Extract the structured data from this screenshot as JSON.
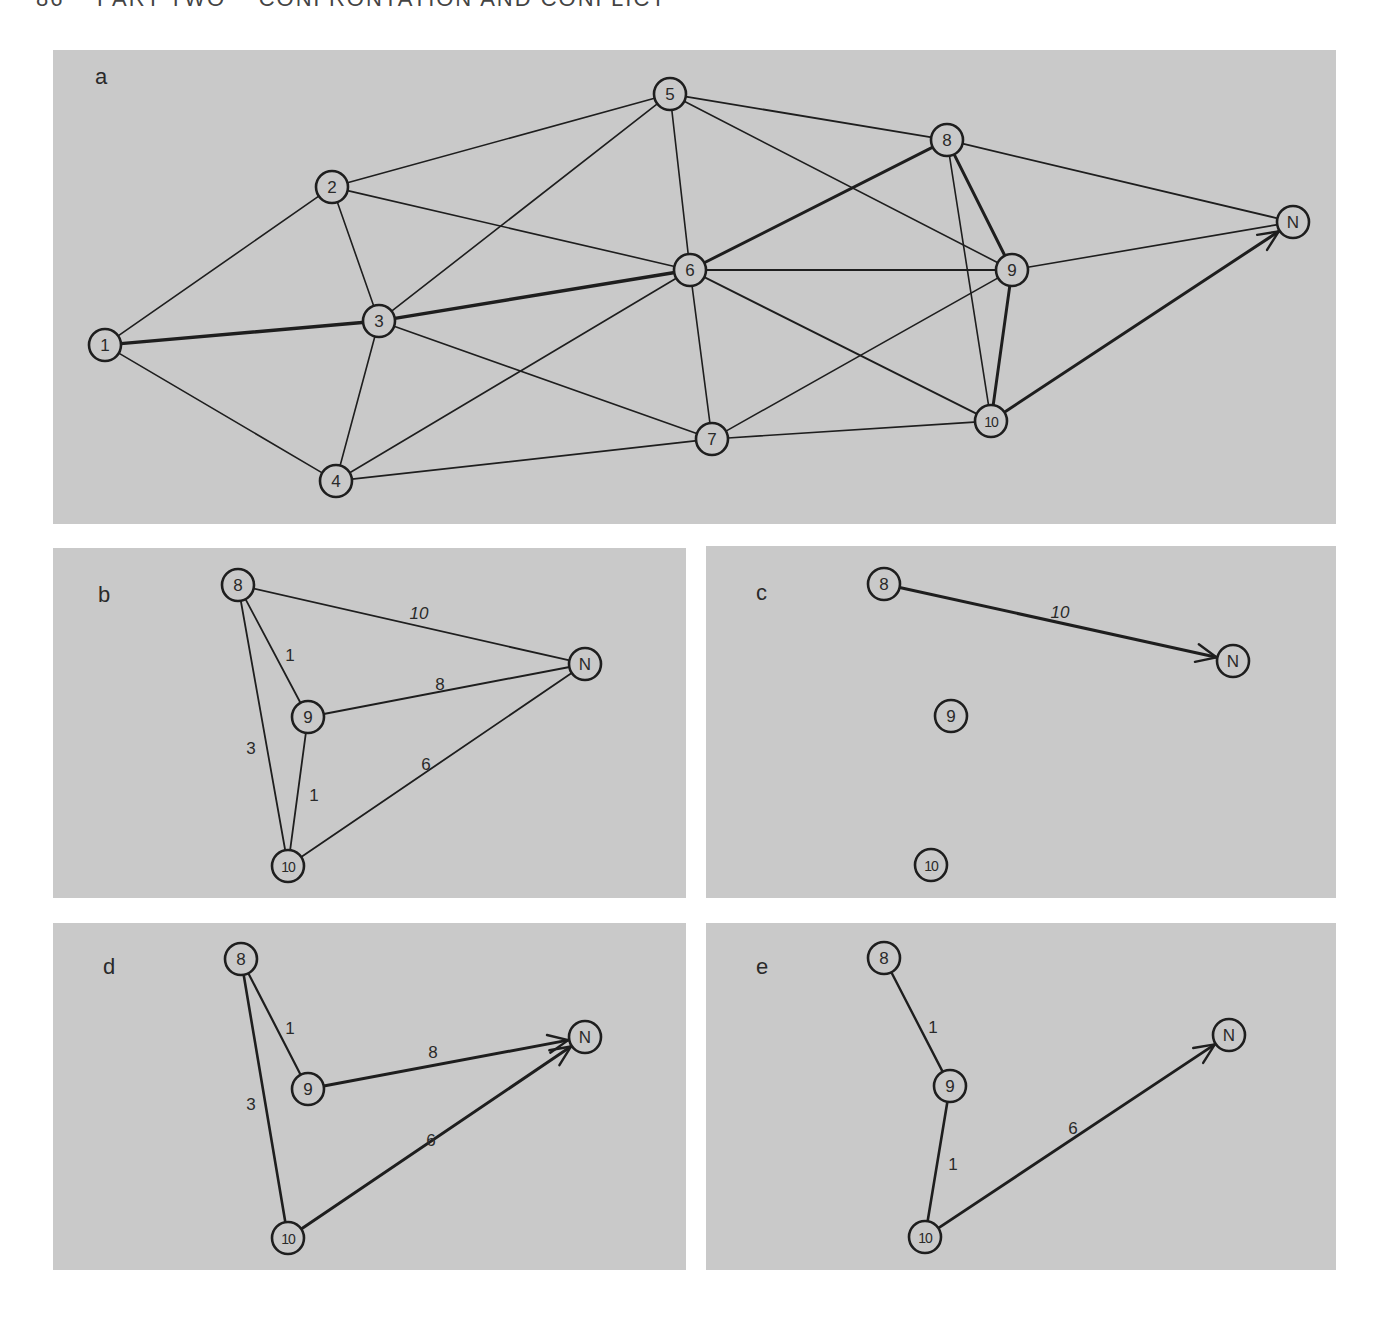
{
  "page_header": "86    PART TWO    CONFRONTATION AND CONFLICT",
  "style": {
    "panel_bg": "#c9c9c9",
    "node_fill": "#c9c9c9",
    "stroke": "#1e1e1e",
    "text": "#2a2a2a"
  },
  "panels": [
    {
      "id": "a",
      "label": "a",
      "box": {
        "x": 53,
        "y": 50,
        "w": 1283,
        "h": 474
      },
      "label_pos": {
        "x": 95,
        "y": 78
      },
      "nodes": [
        {
          "id": "1",
          "x": 105,
          "y": 345
        },
        {
          "id": "2",
          "x": 332,
          "y": 187
        },
        {
          "id": "3",
          "x": 379,
          "y": 321
        },
        {
          "id": "4",
          "x": 336,
          "y": 481
        },
        {
          "id": "5",
          "x": 670,
          "y": 94
        },
        {
          "id": "6",
          "x": 690,
          "y": 270
        },
        {
          "id": "7",
          "x": 712,
          "y": 439
        },
        {
          "id": "8",
          "x": 947,
          "y": 140
        },
        {
          "id": "9",
          "x": 1012,
          "y": 270
        },
        {
          "id": "10",
          "x": 991,
          "y": 421
        },
        {
          "id": "N",
          "x": 1293,
          "y": 222
        }
      ],
      "edges": [
        {
          "from": "1",
          "to": "2",
          "w": 1.6
        },
        {
          "from": "1",
          "to": "3",
          "w": 3.4
        },
        {
          "from": "1",
          "to": "4",
          "w": 1.6
        },
        {
          "from": "2",
          "to": "3",
          "w": 1.6
        },
        {
          "from": "2",
          "to": "5",
          "w": 1.6
        },
        {
          "from": "2",
          "to": "6",
          "w": 1.6
        },
        {
          "from": "3",
          "to": "4",
          "w": 1.6
        },
        {
          "from": "3",
          "to": "5",
          "w": 1.6
        },
        {
          "from": "3",
          "to": "6",
          "w": 3.4
        },
        {
          "from": "3",
          "to": "7",
          "w": 1.6
        },
        {
          "from": "4",
          "to": "6",
          "w": 1.6
        },
        {
          "from": "4",
          "to": "7",
          "w": 1.8
        },
        {
          "from": "5",
          "to": "6",
          "w": 1.6
        },
        {
          "from": "5",
          "to": "8",
          "w": 1.8
        },
        {
          "from": "5",
          "to": "9",
          "w": 1.6
        },
        {
          "from": "6",
          "to": "7",
          "w": 1.6
        },
        {
          "from": "6",
          "to": "8",
          "w": 3.0
        },
        {
          "from": "6",
          "to": "9",
          "w": 1.8
        },
        {
          "from": "6",
          "to": "10",
          "w": 1.8
        },
        {
          "from": "7",
          "to": "9",
          "w": 1.6
        },
        {
          "from": "7",
          "to": "10",
          "w": 1.6
        },
        {
          "from": "8",
          "to": "9",
          "w": 3.0
        },
        {
          "from": "8",
          "to": "10",
          "w": 1.6
        },
        {
          "from": "8",
          "to": "N",
          "w": 1.8
        },
        {
          "from": "9",
          "to": "10",
          "w": 3.0
        },
        {
          "from": "9",
          "to": "N",
          "w": 1.6
        },
        {
          "from": "10",
          "to": "N",
          "w": 3.0,
          "arrow": true
        }
      ]
    },
    {
      "id": "b",
      "label": "b",
      "box": {
        "x": 53,
        "y": 548,
        "w": 633,
        "h": 350
      },
      "label_pos": {
        "x": 98,
        "y": 596
      },
      "nodes": [
        {
          "id": "8",
          "x": 238,
          "y": 585
        },
        {
          "id": "9",
          "x": 308,
          "y": 717
        },
        {
          "id": "10",
          "x": 288,
          "y": 866
        },
        {
          "id": "N",
          "x": 585,
          "y": 664
        }
      ],
      "edges": [
        {
          "from": "8",
          "to": "N",
          "w": 1.8,
          "weight_label": "10",
          "label_pos": {
            "x": 419,
            "y": 613
          }
        },
        {
          "from": "8",
          "to": "9",
          "w": 1.8,
          "weight_label": "1",
          "label_pos": {
            "x": 290,
            "y": 655
          }
        },
        {
          "from": "8",
          "to": "10",
          "w": 1.8,
          "weight_label": "3",
          "label_pos": {
            "x": 251,
            "y": 748
          }
        },
        {
          "from": "9",
          "to": "N",
          "w": 2.0,
          "weight_label": "8",
          "label_pos": {
            "x": 440,
            "y": 684
          }
        },
        {
          "from": "9",
          "to": "10",
          "w": 1.8,
          "weight_label": "1",
          "label_pos": {
            "x": 314,
            "y": 795
          }
        },
        {
          "from": "10",
          "to": "N",
          "w": 1.8,
          "weight_label": "6",
          "label_pos": {
            "x": 426,
            "y": 764
          }
        }
      ]
    },
    {
      "id": "c",
      "label": "c",
      "box": {
        "x": 706,
        "y": 546,
        "w": 630,
        "h": 352
      },
      "label_pos": {
        "x": 756,
        "y": 594
      },
      "nodes": [
        {
          "id": "8",
          "x": 884,
          "y": 584
        },
        {
          "id": "9",
          "x": 951,
          "y": 716
        },
        {
          "id": "10",
          "x": 931,
          "y": 865
        },
        {
          "id": "N",
          "x": 1233,
          "y": 661
        }
      ],
      "edges": [
        {
          "from": "8",
          "to": "N",
          "w": 3.0,
          "arrow": true,
          "weight_label": "10",
          "label_pos": {
            "x": 1060,
            "y": 612
          }
        }
      ]
    },
    {
      "id": "d",
      "label": "d",
      "box": {
        "x": 53,
        "y": 923,
        "w": 633,
        "h": 347
      },
      "label_pos": {
        "x": 103,
        "y": 968
      },
      "nodes": [
        {
          "id": "8",
          "x": 241,
          "y": 959
        },
        {
          "id": "9",
          "x": 308,
          "y": 1089
        },
        {
          "id": "10",
          "x": 288,
          "y": 1238
        },
        {
          "id": "N",
          "x": 585,
          "y": 1037
        }
      ],
      "edges": [
        {
          "from": "8",
          "to": "9",
          "w": 2.2,
          "weight_label": "1",
          "label_pos": {
            "x": 290,
            "y": 1028
          }
        },
        {
          "from": "8",
          "to": "10",
          "w": 2.6,
          "weight_label": "3",
          "label_pos": {
            "x": 251,
            "y": 1104
          }
        },
        {
          "from": "9",
          "to": "N",
          "w": 3.0,
          "arrow": true,
          "weight_label": "8",
          "label_pos": {
            "x": 433,
            "y": 1052
          }
        },
        {
          "from": "10",
          "to": "N",
          "w": 3.0,
          "arrow": true,
          "weight_label": "6",
          "label_pos": {
            "x": 431,
            "y": 1140
          }
        }
      ]
    },
    {
      "id": "e",
      "label": "e",
      "box": {
        "x": 706,
        "y": 923,
        "w": 630,
        "h": 347
      },
      "label_pos": {
        "x": 756,
        "y": 968
      },
      "nodes": [
        {
          "id": "8",
          "x": 884,
          "y": 958
        },
        {
          "id": "9",
          "x": 950,
          "y": 1086
        },
        {
          "id": "10",
          "x": 925,
          "y": 1237
        },
        {
          "id": "N",
          "x": 1229,
          "y": 1035
        }
      ],
      "edges": [
        {
          "from": "8",
          "to": "9",
          "w": 2.4,
          "weight_label": "1",
          "label_pos": {
            "x": 933,
            "y": 1027
          }
        },
        {
          "from": "9",
          "to": "10",
          "w": 2.6,
          "weight_label": "1",
          "label_pos": {
            "x": 953,
            "y": 1164
          }
        },
        {
          "from": "10",
          "to": "N",
          "w": 2.8,
          "arrow": true,
          "weight_label": "6",
          "label_pos": {
            "x": 1073,
            "y": 1128
          }
        }
      ]
    }
  ]
}
